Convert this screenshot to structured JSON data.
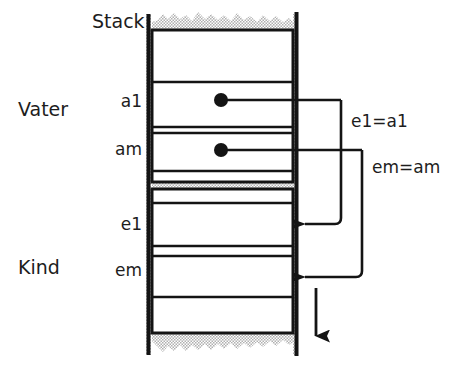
{
  "diagram": {
    "title_label": "Stack",
    "regions": [
      {
        "name": "Vater",
        "label": "Vater"
      },
      {
        "name": "Kind",
        "label": "Kind"
      }
    ],
    "slot_labels": {
      "a1": "a1",
      "am": "am",
      "e1": "e1",
      "em": "em"
    },
    "assignments": [
      {
        "name": "e1-equals-a1",
        "text": "e1=a1"
      },
      {
        "name": "em-equals-am",
        "text": "em=am"
      }
    ],
    "colors": {
      "ink": "#1d1d1d",
      "line": "#141414",
      "hatch": "#b9b9b9",
      "background": "#ffffff"
    }
  }
}
